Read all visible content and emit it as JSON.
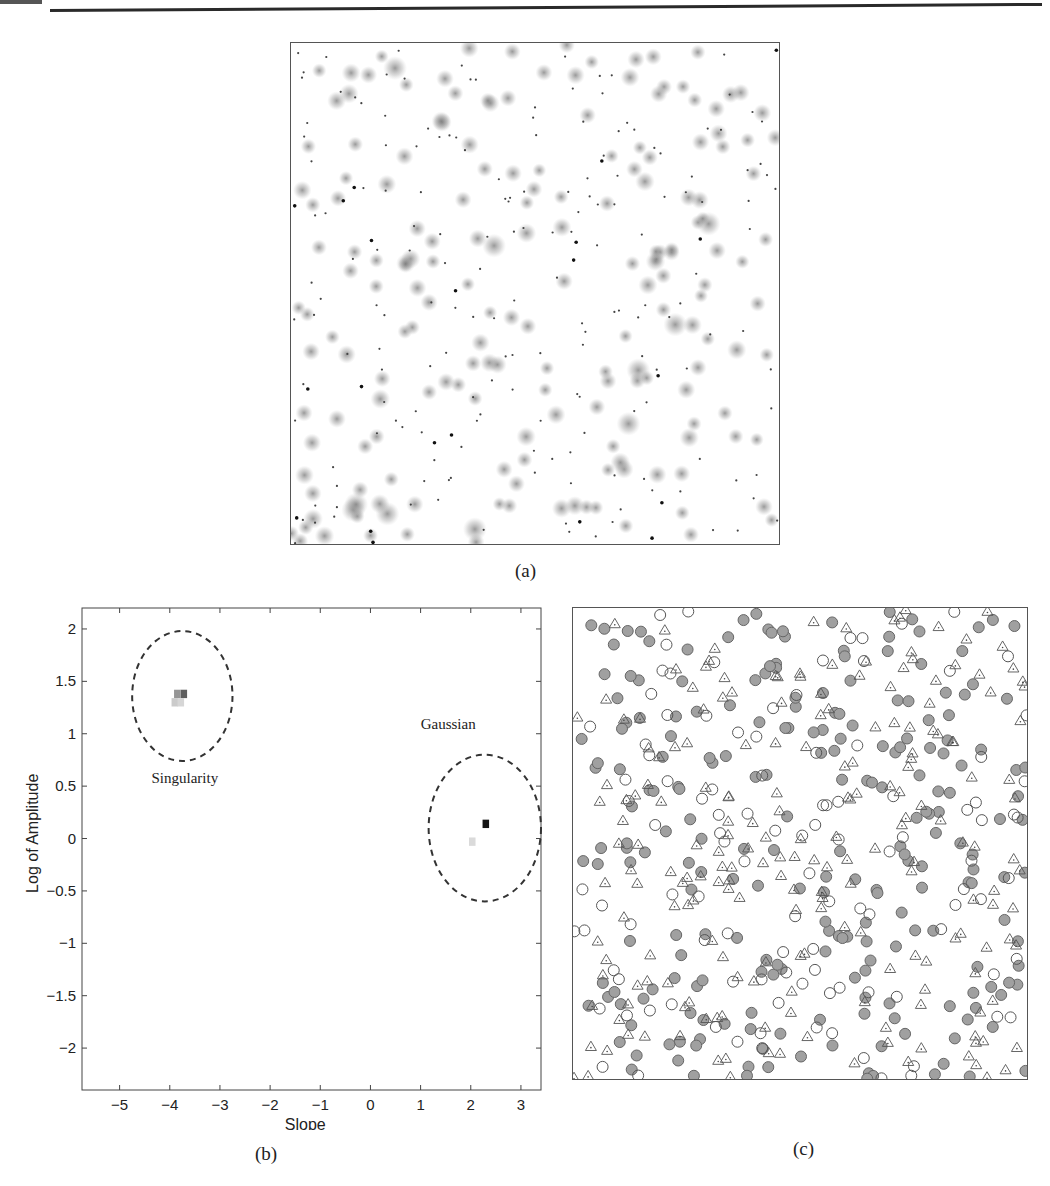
{
  "page": {
    "header": {
      "rule": "horizontal-rule"
    },
    "subfigures": [
      {
        "id": "a",
        "label": "(a)",
        "description": "Synthetic image with Gaussian blobs and point singularities"
      },
      {
        "id": "b",
        "label": "(b)",
        "description": "Slope vs log amplitude feature space"
      },
      {
        "id": "c",
        "label": "(c)",
        "description": "Detected features overlay"
      }
    ]
  },
  "chart_data": [
    {
      "type": "scatter",
      "panel": "a",
      "title": "",
      "xlabel": "",
      "ylabel": "",
      "axes_visible": false,
      "grid": false,
      "series": [
        {
          "name": "gaussian-blobs",
          "marker": "soft-gray-blob",
          "count_approx": 190
        },
        {
          "name": "point-singularities",
          "marker": "small-dark-dot",
          "count_approx": 200
        }
      ]
    },
    {
      "type": "heatmap",
      "panel": "b",
      "title": "",
      "xlabel": "Slope",
      "ylabel": "Log of Amplitude",
      "xlim": [
        -5.75,
        3.4
      ],
      "ylim": [
        -2.4,
        2.2
      ],
      "xticks": [
        -5,
        -4,
        -3,
        -2,
        -1,
        0,
        1,
        2,
        3
      ],
      "yticks": [
        2,
        1.5,
        1,
        0.5,
        0,
        -0.5,
        -1,
        -1.5,
        -2
      ],
      "xtick_labels": [
        "−5",
        "−4",
        "−3",
        "−2",
        "−1",
        "0",
        "1",
        "2",
        "3"
      ],
      "ytick_labels": [
        "2",
        "1.5",
        "1",
        "0.5",
        "0",
        "−0.5",
        "−1",
        "−1.5",
        "−2"
      ],
      "grid": false,
      "cells": [
        {
          "x": -3.72,
          "y": 1.38,
          "intensity": 0.65
        },
        {
          "x": -3.85,
          "y": 1.38,
          "intensity": 0.4
        },
        {
          "x": -3.9,
          "y": 1.3,
          "intensity": 0.15
        },
        {
          "x": -3.78,
          "y": 1.3,
          "intensity": 0.1
        },
        {
          "x": 2.3,
          "y": 0.14,
          "intensity": 1.0
        },
        {
          "x": 2.03,
          "y": -0.03,
          "intensity": 0.08
        }
      ],
      "clusters": [
        {
          "name": "Singularity",
          "center": [
            -3.75,
            1.36
          ],
          "radius_x": 1.0,
          "radius_y": 0.62,
          "label_pos": [
            -3.7,
            0.53
          ]
        },
        {
          "name": "Gaussian",
          "center": [
            2.28,
            0.1
          ],
          "radius_x": 1.12,
          "radius_y": 0.7,
          "label_pos": [
            1.55,
            1.05
          ]
        }
      ]
    },
    {
      "type": "scatter",
      "panel": "c",
      "title": "",
      "xlabel": "",
      "ylabel": "",
      "axes_visible": false,
      "grid": false,
      "legend": "none",
      "series": [
        {
          "name": "gaussian-detections",
          "marker": "filled-gray-circle",
          "count_approx": 230
        },
        {
          "name": "singularity-detections",
          "marker": "open-triangle",
          "count_approx": 210
        },
        {
          "name": "ground-truth",
          "marker": "open-circle",
          "count_approx": 110
        }
      ]
    }
  ],
  "colors": {
    "axis": "#444444",
    "blob": "#8a8a8a",
    "dot": "#2b2b2b",
    "filled_circle": "#9a9a9a",
    "circle_stroke": "#555555",
    "dashed_ellipse": "#333333"
  }
}
